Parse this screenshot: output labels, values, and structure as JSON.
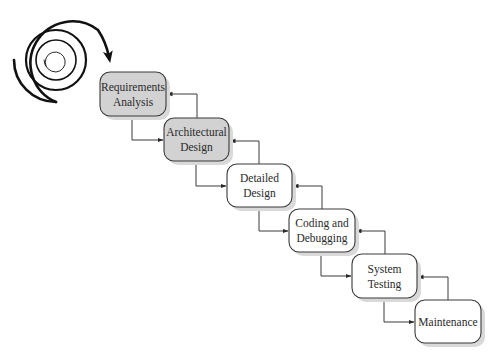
{
  "diagram": {
    "type": "waterfall-model",
    "stages": [
      {
        "id": "requirements",
        "lines": [
          "Requirements",
          "Analysis"
        ],
        "x": 100,
        "y": 72,
        "w": 66,
        "h": 44,
        "shaded": true
      },
      {
        "id": "architectural",
        "lines": [
          "Architectural",
          "Design"
        ],
        "x": 164,
        "y": 118,
        "w": 65,
        "h": 43,
        "shaded": true
      },
      {
        "id": "detailed",
        "lines": [
          "Detailed",
          "Design"
        ],
        "x": 227,
        "y": 164,
        "w": 65,
        "h": 43,
        "shaded": false
      },
      {
        "id": "coding",
        "lines": [
          "Coding and",
          "Debugging"
        ],
        "x": 289,
        "y": 209,
        "w": 66,
        "h": 43,
        "shaded": false
      },
      {
        "id": "system-testing",
        "lines": [
          "System",
          "Testing"
        ],
        "x": 352,
        "y": 254,
        "w": 65,
        "h": 44,
        "shaded": false
      },
      {
        "id": "maintenance",
        "lines": [
          "Maintenance"
        ],
        "x": 415,
        "y": 300,
        "w": 66,
        "h": 43,
        "shaded": false
      }
    ],
    "colors": {
      "shaded_fill": "#d2d2d2",
      "plain_fill": "#ffffff",
      "border": "#3a3a3a",
      "shadow": "#d9d9d9",
      "spiral": "#111111"
    },
    "spiral": {
      "cx": 56,
      "cy": 60,
      "outer_radius": 42,
      "arrow_tip": [
        110,
        63
      ]
    }
  }
}
